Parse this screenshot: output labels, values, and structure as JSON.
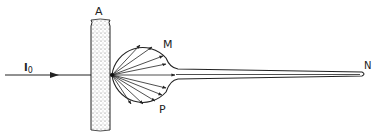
{
  "diagram": {
    "labels": {
      "slab": "A",
      "incident_beam": "I",
      "incident_beam_subscript": "0",
      "bulb_top": "M",
      "bulb_bottom": "P",
      "tube_end": "N"
    },
    "elements": [
      {
        "name": "incident-beam",
        "description": "horizontal ray with arrow entering from left"
      },
      {
        "name": "slab-A",
        "description": "stippled vertical slab"
      },
      {
        "name": "spherical-bulb",
        "description": "sphere with scattered rays radiating from entry point"
      },
      {
        "name": "capillary-tube",
        "description": "long narrowing tube from bulb to point N"
      }
    ],
    "scattered_ray_count": 10,
    "colors": {
      "ink": "#222222",
      "background": "#ffffff",
      "stipple": "#555555"
    }
  }
}
